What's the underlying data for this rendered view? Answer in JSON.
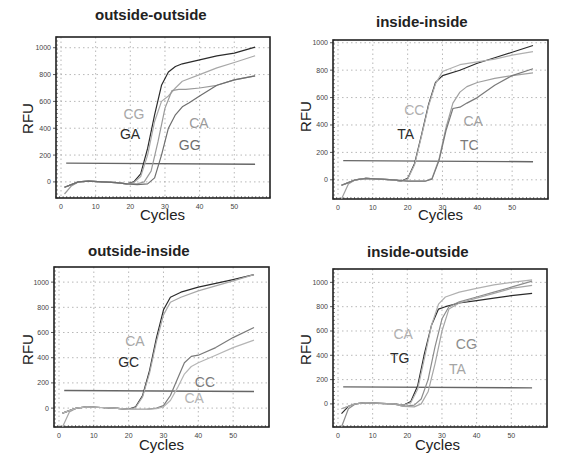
{
  "chart_data": [
    {
      "type": "line",
      "title": "outside-outside",
      "xlabel": "Cycles",
      "ylabel": "RFU",
      "xlim": [
        0,
        58
      ],
      "ylim": [
        -120,
        1080
      ],
      "xticks": [
        0,
        10,
        20,
        30,
        40,
        50
      ],
      "yticks": [
        0,
        200,
        400,
        600,
        800,
        1000
      ],
      "grid": true,
      "threshold": 140,
      "series": [
        {
          "name": "GA",
          "color": "#2b2b2b",
          "x": [
            1,
            3,
            5,
            8,
            12,
            16,
            19,
            21,
            23,
            25,
            27,
            29,
            31,
            33,
            35,
            40,
            45,
            50,
            56
          ],
          "y": [
            -40,
            -20,
            0,
            5,
            0,
            -5,
            -15,
            0,
            60,
            250,
            500,
            720,
            820,
            860,
            880,
            910,
            940,
            960,
            1005
          ]
        },
        {
          "name": "CG",
          "color": "#a8a8a8",
          "x": [
            1,
            3,
            5,
            8,
            12,
            16,
            19,
            21,
            23,
            25,
            27,
            29,
            31,
            33,
            35,
            40,
            45,
            50,
            56
          ],
          "y": [
            -40,
            -20,
            0,
            5,
            0,
            -5,
            -15,
            -5,
            40,
            200,
            450,
            600,
            640,
            700,
            750,
            800,
            850,
            890,
            940
          ]
        },
        {
          "name": "CA",
          "color": "#9a9a9a",
          "x": [
            1,
            3,
            5,
            8,
            12,
            16,
            19,
            22,
            24,
            26,
            28,
            30,
            32,
            34,
            36,
            40,
            45,
            50,
            56
          ],
          "y": [
            -90,
            -30,
            0,
            5,
            0,
            -5,
            -15,
            -15,
            0,
            80,
            300,
            550,
            680,
            690,
            690,
            700,
            720,
            760,
            790
          ]
        },
        {
          "name": "GG",
          "color": "#6e6e6e",
          "x": [
            1,
            3,
            5,
            8,
            12,
            16,
            19,
            22,
            25,
            27,
            29,
            31,
            33,
            35,
            37,
            40,
            45,
            50,
            56
          ],
          "y": [
            -40,
            -20,
            0,
            5,
            0,
            -5,
            -15,
            -20,
            -15,
            30,
            200,
            400,
            500,
            560,
            590,
            640,
            720,
            760,
            790
          ]
        }
      ],
      "labels": [
        {
          "text": "CG",
          "series": "CG",
          "x": 18,
          "y": 470
        },
        {
          "text": "GA",
          "series": "GA",
          "x": 17,
          "y": 320
        },
        {
          "text": "CA",
          "series": "CA",
          "x": 37,
          "y": 400
        },
        {
          "text": "GG",
          "series": "GG",
          "x": 34,
          "y": 235
        }
      ]
    },
    {
      "type": "line",
      "title": "inside-inside",
      "xlabel": "Cycles",
      "ylabel": "RFU",
      "xlim": [
        0,
        58
      ],
      "ylim": [
        -140,
        1020
      ],
      "xticks": [
        0,
        10,
        20,
        30,
        40,
        50
      ],
      "yticks": [
        0,
        200,
        400,
        600,
        800,
        1000
      ],
      "grid": true,
      "threshold": 140,
      "series": [
        {
          "name": "TA",
          "color": "#2b2b2b",
          "x": [
            1,
            3,
            5,
            8,
            12,
            16,
            18,
            20,
            22,
            24,
            26,
            28,
            30,
            35,
            40,
            45,
            50,
            56
          ],
          "y": [
            -40,
            -20,
            0,
            10,
            5,
            0,
            -10,
            10,
            120,
            330,
            550,
            710,
            760,
            800,
            850,
            890,
            930,
            980
          ]
        },
        {
          "name": "CC",
          "color": "#b0b0b0",
          "x": [
            1,
            3,
            5,
            8,
            12,
            16,
            18,
            20,
            22,
            24,
            26,
            28,
            30,
            35,
            40,
            45,
            50,
            56
          ],
          "y": [
            -40,
            -20,
            0,
            10,
            5,
            0,
            -10,
            5,
            110,
            320,
            540,
            700,
            790,
            840,
            860,
            880,
            910,
            935
          ]
        },
        {
          "name": "CA",
          "color": "#a0a0a0",
          "x": [
            1,
            3,
            5,
            8,
            12,
            16,
            20,
            25,
            27,
            29,
            31,
            33,
            35,
            37,
            40,
            45,
            50,
            56
          ],
          "y": [
            -140,
            -30,
            0,
            10,
            5,
            0,
            -10,
            -10,
            10,
            150,
            380,
            560,
            640,
            680,
            710,
            740,
            760,
            780
          ]
        },
        {
          "name": "TC",
          "color": "#7a7a7a",
          "x": [
            1,
            3,
            5,
            8,
            12,
            16,
            20,
            25,
            27,
            29,
            31,
            33,
            35,
            37,
            40,
            45,
            50,
            56
          ],
          "y": [
            -40,
            -20,
            0,
            10,
            5,
            0,
            -10,
            -10,
            5,
            140,
            360,
            520,
            530,
            560,
            600,
            690,
            760,
            810
          ]
        }
      ],
      "labels": [
        {
          "text": "CC",
          "series": "CC",
          "x": 19,
          "y": 470
        },
        {
          "text": "TA",
          "series": "TA",
          "x": 17,
          "y": 300
        },
        {
          "text": "CA",
          "series": "CA",
          "x": 36,
          "y": 390
        },
        {
          "text": "TC",
          "series": "TC",
          "x": 35,
          "y": 215
        }
      ]
    },
    {
      "type": "line",
      "title": "outside-inside",
      "xlabel": "Cycles",
      "ylabel": "RFU",
      "xlim": [
        0,
        58
      ],
      "ylim": [
        -150,
        1120
      ],
      "xticks": [
        0,
        10,
        20,
        30,
        40,
        50
      ],
      "yticks": [
        0,
        200,
        400,
        600,
        800,
        1000
      ],
      "grid": true,
      "threshold": 140,
      "series": [
        {
          "name": "GC",
          "color": "#2b2b2b",
          "x": [
            1,
            3,
            5,
            8,
            12,
            16,
            20,
            22,
            24,
            26,
            28,
            30,
            32,
            35,
            40,
            45,
            50,
            56
          ],
          "y": [
            -40,
            -20,
            0,
            10,
            5,
            0,
            -10,
            10,
            100,
            300,
            560,
            780,
            880,
            920,
            960,
            990,
            1020,
            1060
          ]
        },
        {
          "name": "CA",
          "color": "#a8a8a8",
          "x": [
            1,
            3,
            5,
            8,
            12,
            16,
            20,
            22,
            24,
            26,
            28,
            30,
            32,
            35,
            40,
            45,
            50,
            56
          ],
          "y": [
            -150,
            -30,
            0,
            10,
            5,
            0,
            -10,
            5,
            90,
            280,
            530,
            740,
            840,
            880,
            930,
            970,
            1010,
            1060
          ]
        },
        {
          "name": "CC",
          "color": "#7a7a7a",
          "x": [
            1,
            3,
            5,
            8,
            12,
            16,
            20,
            25,
            28,
            30,
            32,
            34,
            36,
            38,
            40,
            45,
            50,
            56
          ],
          "y": [
            -40,
            -20,
            0,
            10,
            5,
            0,
            -10,
            -10,
            0,
            20,
            100,
            230,
            360,
            410,
            420,
            480,
            560,
            640
          ]
        },
        {
          "name": "CA2",
          "color": "#b5b5b5",
          "x": [
            1,
            3,
            5,
            8,
            12,
            16,
            20,
            25,
            28,
            30,
            32,
            34,
            36,
            38,
            40,
            45,
            50,
            56
          ],
          "y": [
            -40,
            -20,
            0,
            10,
            5,
            0,
            -10,
            -10,
            -5,
            10,
            60,
            160,
            270,
            330,
            360,
            420,
            480,
            540
          ]
        }
      ],
      "labels": [
        {
          "text": "CA",
          "series": "CA",
          "x": 19,
          "y": 490
        },
        {
          "text": "GC",
          "series": "GC",
          "x": 17,
          "y": 330
        },
        {
          "text": "CC",
          "series": "CC",
          "x": 39,
          "y": 170
        },
        {
          "text": "CA",
          "series": "CA2",
          "x": 36,
          "y": 40
        }
      ]
    },
    {
      "type": "line",
      "title": "inside-outside",
      "xlabel": "Cycles",
      "ylabel": "RFU",
      "xlim": [
        0,
        58
      ],
      "ylim": [
        -190,
        1110
      ],
      "xticks": [
        0,
        10,
        20,
        30,
        40,
        50
      ],
      "yticks": [
        0,
        200,
        400,
        600,
        800,
        1000
      ],
      "grid": true,
      "threshold": 140,
      "series": [
        {
          "name": "TG",
          "color": "#2b2b2b",
          "x": [
            1,
            3,
            5,
            8,
            12,
            16,
            19,
            21,
            23,
            25,
            27,
            29,
            31,
            35,
            40,
            45,
            50,
            56
          ],
          "y": [
            -80,
            -20,
            0,
            10,
            5,
            0,
            -10,
            20,
            150,
            420,
            650,
            780,
            800,
            830,
            850,
            870,
            890,
            910
          ]
        },
        {
          "name": "CA",
          "color": "#b0b0b0",
          "x": [
            1,
            3,
            5,
            8,
            12,
            16,
            19,
            21,
            23,
            25,
            27,
            29,
            31,
            35,
            40,
            45,
            50,
            56
          ],
          "y": [
            -40,
            -20,
            0,
            10,
            5,
            0,
            -10,
            10,
            120,
            380,
            650,
            820,
            880,
            920,
            950,
            980,
            1000,
            1020
          ]
        },
        {
          "name": "CG",
          "color": "#8c8c8c",
          "x": [
            1,
            3,
            5,
            8,
            12,
            16,
            19,
            22,
            24,
            26,
            28,
            30,
            32,
            35,
            40,
            45,
            50,
            56
          ],
          "y": [
            -190,
            -40,
            0,
            10,
            5,
            0,
            -20,
            -10,
            40,
            200,
            470,
            700,
            800,
            840,
            880,
            920,
            960,
            1010
          ]
        },
        {
          "name": "TA",
          "color": "#a5a5a5",
          "x": [
            1,
            3,
            5,
            8,
            12,
            16,
            19,
            22,
            24,
            26,
            28,
            30,
            32,
            35,
            40,
            45,
            50,
            56
          ],
          "y": [
            -40,
            -20,
            0,
            10,
            5,
            0,
            -20,
            -25,
            0,
            100,
            330,
            600,
            780,
            830,
            870,
            910,
            950,
            975
          ]
        }
      ],
      "labels": [
        {
          "text": "CA",
          "series": "CA",
          "x": 16,
          "y": 530
        },
        {
          "text": "TG",
          "series": "TG",
          "x": 15,
          "y": 340
        },
        {
          "text": "CG",
          "series": "CG",
          "x": 34,
          "y": 450
        },
        {
          "text": "TA",
          "series": "TA",
          "x": 32,
          "y": 250
        }
      ]
    }
  ],
  "panels": [
    {
      "title": "outside-outside",
      "xlabel": "Cycles",
      "ylabel": "RFU"
    },
    {
      "title": "inside-inside",
      "xlabel": "Cycles",
      "ylabel": "RFU"
    },
    {
      "title": "outside-inside",
      "xlabel": "Cycles",
      "ylabel": "RFU"
    },
    {
      "title": "inside-outside",
      "xlabel": "Cycles",
      "ylabel": "RFU"
    }
  ]
}
